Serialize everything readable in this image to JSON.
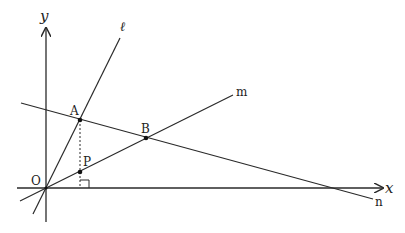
{
  "diagram": {
    "type": "coordinate-geometry",
    "axes": {
      "x_label": "x",
      "y_label": "y",
      "origin_label": "O"
    },
    "lines": [
      {
        "id": "l",
        "label": "ℓ",
        "passes_through": [
          "O",
          "A"
        ]
      },
      {
        "id": "m",
        "label": "m",
        "passes_through": [
          "O",
          "P",
          "B"
        ]
      },
      {
        "id": "n",
        "label": "n",
        "passes_through": [
          "A",
          "B"
        ]
      }
    ],
    "points": [
      {
        "label": "O",
        "x": 46,
        "y": 188
      },
      {
        "label": "A",
        "x": 80,
        "y": 120
      },
      {
        "label": "B",
        "x": 146,
        "y": 138
      },
      {
        "label": "P",
        "x": 80,
        "y": 172
      }
    ],
    "annotations": {
      "dashed_segment": "A to foot on x-axis through P",
      "right_angle_marker": "at foot of perpendicular from A on x-axis"
    },
    "colors": {
      "stroke": "#2a2a2a",
      "background": "#ffffff"
    }
  }
}
